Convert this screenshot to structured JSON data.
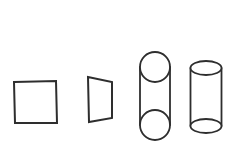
{
  "figure": {
    "background_color": "#ffffff",
    "stroke_color": "#2e2e2e",
    "canvas_width": 238,
    "canvas_height": 154,
    "shape_count": 4
  },
  "shapes": [
    {
      "index": 1,
      "name": "square",
      "label": "Square",
      "type": "polygon",
      "filled": false,
      "stroke_color": "#2e2e2e",
      "fill_color": "#ffffff",
      "bounds": {
        "x": 14,
        "y": 81,
        "width": 43,
        "height": 42
      },
      "points": "14,82 56,81 57,123 15,123"
    },
    {
      "index": 2,
      "name": "trapezoid",
      "label": "Trapezoid",
      "type": "polygon",
      "filled": false,
      "stroke_color": "#2e2e2e",
      "fill_color": "#ffffff",
      "bounds": {
        "x": 88,
        "y": 76,
        "width": 25,
        "height": 47
      },
      "points": "88,77 112,82 112,118 89,122"
    },
    {
      "index": 3,
      "name": "capsule-cylinder",
      "label": "Capsule cylinder",
      "type": "capsule",
      "filled": false,
      "stroke_color": "#2e2e2e",
      "fill_color": "#ffffff",
      "bounds": {
        "x": 140,
        "y": 52,
        "width": 30,
        "height": 88
      },
      "top_circle": {
        "cx": 155,
        "cy": 67,
        "r": 15
      },
      "bottom_circle": {
        "cx": 155,
        "cy": 125,
        "r": 15
      },
      "left_side": {
        "x1": 140,
        "y1": 67,
        "x2": 140,
        "y2": 125
      },
      "right_side": {
        "x1": 170,
        "y1": 67,
        "x2": 170,
        "y2": 125
      }
    },
    {
      "index": 4,
      "name": "cylinder",
      "label": "Cylinder",
      "type": "cylinder",
      "filled": false,
      "stroke_color": "#2e2e2e",
      "fill_color": "#ffffff",
      "bounds": {
        "x": 191,
        "y": 61,
        "width": 31,
        "height": 72
      },
      "top_ellipse": {
        "cx": 206,
        "cy": 68,
        "rx": 15.5,
        "ry": 7
      },
      "bottom_ellipse": {
        "cx": 206,
        "cy": 126,
        "rx": 15.5,
        "ry": 7
      },
      "left_side": {
        "x1": 190.5,
        "y1": 68,
        "x2": 190.5,
        "y2": 126
      },
      "right_side": {
        "x1": 221.5,
        "y1": 68,
        "x2": 221.5,
        "y2": 126
      }
    }
  ]
}
